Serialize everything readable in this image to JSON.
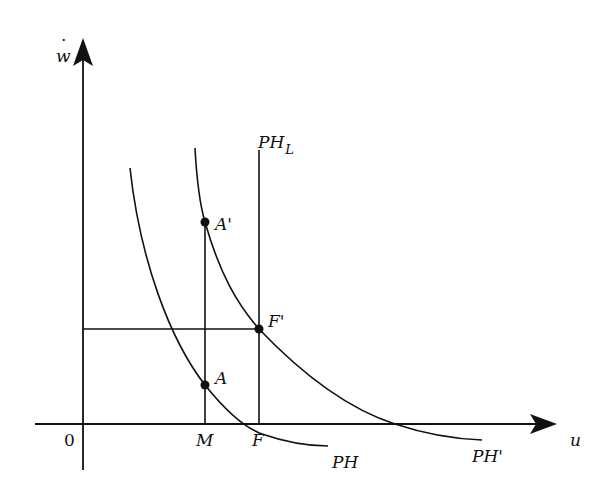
{
  "axes": {
    "y_label": "w",
    "y_label_dot": "·",
    "x_label": "u",
    "origin_label": "0"
  },
  "x_ticks": {
    "M": "M",
    "F": "F"
  },
  "curves": {
    "PH": "PH",
    "PH_prime": "PH'",
    "PH_L_main": "PH",
    "PH_L_sub": "L"
  },
  "points": {
    "A": "A",
    "A_prime": "A'",
    "F_prime": "F'"
  },
  "colors": {
    "ink": "#111111",
    "background": "#ffffff"
  }
}
